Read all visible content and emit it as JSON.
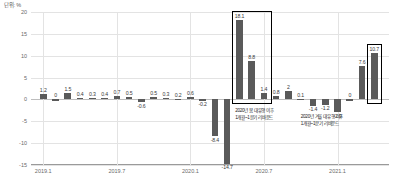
{
  "unit_label": "단위: %",
  "chart_data": {
    "type": "bar",
    "title": "",
    "subtitle": "",
    "xlabel": "",
    "ylabel": "",
    "unit": "%",
    "ylim": [
      -15,
      20
    ],
    "yticks": [
      20,
      15,
      10,
      5,
      0,
      -5,
      -10,
      -15
    ],
    "grid": true,
    "legend": null,
    "xtick_labels": [
      "2019.1",
      "2019.7",
      "2020.1",
      "2020.7",
      "2021.1"
    ],
    "xtick_indices": [
      0,
      6,
      12,
      18,
      24
    ],
    "categories": [
      "2019.1",
      "2019.2",
      "2019.3",
      "2019.4",
      "2019.5",
      "2019.6",
      "2019.7",
      "2019.8",
      "2019.9",
      "2019.10",
      "2019.11",
      "2019.12",
      "2020.1",
      "2020.2",
      "2020.3",
      "2020.4",
      "2020.5",
      "2020.6",
      "2020.7",
      "2020.8",
      "2020.9",
      "2020.10",
      "2020.11",
      "2020.12",
      "2021.1",
      "2021.2",
      "2021.3",
      "2021.4"
    ],
    "values": [
      1.2,
      0,
      1.5,
      0.4,
      0.3,
      0.4,
      0.7,
      0.5,
      -0.6,
      0.5,
      0.3,
      0.2,
      0.6,
      -0.2,
      -8.4,
      -14.7,
      18.1,
      8.8,
      1.4,
      0.8,
      2,
      0.1,
      -1.4,
      -1.2,
      -2.9,
      0,
      7.6,
      10.7
    ],
    "value_labels": [
      "1.2",
      "0",
      "1.5",
      "0.4",
      "0.3",
      "0.4",
      "0.7",
      "0.5",
      "-0.6",
      "0.5",
      "0.3",
      "0.2",
      "0.6",
      "-0.2",
      "-8.4",
      "-14.7",
      "18.1",
      "8.8",
      "1.4",
      "0.8",
      "2",
      "0.1",
      "-1.4",
      "-1.2",
      "-2.9",
      "0",
      "7.6",
      "10.7"
    ],
    "annotations": [
      {
        "id": "spring-rebound",
        "line1": "2020년 봄 대유행 이후",
        "line2": "1개월~1분기 리바운드",
        "highlight_start_index": 16,
        "highlight_end_index": 18
      },
      {
        "id": "winter-rebound",
        "line1": "2020년 겨울 대유행 이후",
        "line2": "1개월~1분기 리바운드",
        "highlight_start_index": 27,
        "highlight_end_index": 27
      }
    ],
    "bar_color": "#5a5a5a",
    "highlight_border_color": "#000000",
    "grid_color": "#e3e3e3"
  }
}
